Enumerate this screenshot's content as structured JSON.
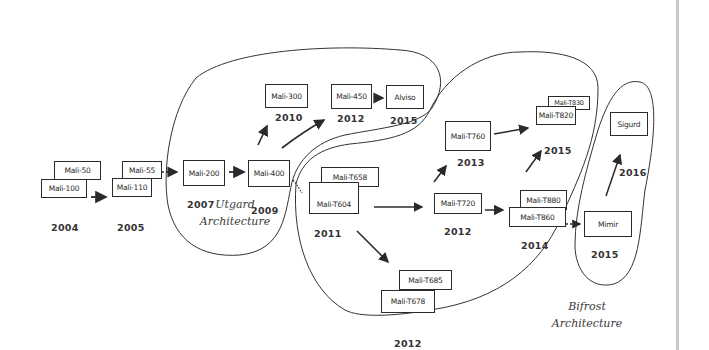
{
  "diagram": {
    "type": "hand-drawn GPU family timeline",
    "colors": {
      "ink": "#2a2a2a",
      "paper": "#ffffff",
      "page_border": "#c9c9c9"
    },
    "architectures": [
      {
        "id": "utgard",
        "line1": "Utgard",
        "line2": "Architecture"
      },
      {
        "id": "midgard",
        "line1": "Midgard",
        "line2": "Architecture"
      },
      {
        "id": "bifrost",
        "line1": "Bifrost",
        "line2": "Architecture"
      }
    ],
    "nodes": {
      "mali50": "Mali-50",
      "mali100": "Mali-100",
      "mali55": "Mali-55",
      "mali110": "Mali-110",
      "mali200": "Mali-200",
      "mali400": "Mali-400",
      "mali300": "Mali-300",
      "mali450": "Mali-450",
      "alviso": "Alviso",
      "t658": "Mali-T658",
      "t604": "Mali-T604",
      "t685": "Mali-T685",
      "t678": "Mali-T678",
      "t720": "Mali-T720",
      "t760": "Mali-T760",
      "t880": "Mali-T880",
      "t860": "Mali-T860",
      "t830": "Mali-T830",
      "t820": "Mali-T820",
      "mimir": "Mimir",
      "sigurd": "Sigurd"
    },
    "years": {
      "y2004": "2004",
      "y2005": "2005",
      "y2007": "2007",
      "y2009": "2009",
      "y2010": "2010",
      "y2012_utgard": "2012",
      "y2015_alviso": "2015",
      "y2011": "2011",
      "y2012_t678": "2012",
      "y2012_t720": "2012",
      "y2013": "2013",
      "y2014": "2014",
      "y2015_t820": "2015",
      "y2015_mimir": "2015",
      "y2016": "2016"
    },
    "edges": [
      {
        "from": "Mali-100",
        "to": "Mali-110",
        "style": "solid"
      },
      {
        "from": "Mali-55",
        "to": "Mali-200",
        "style": "dotted"
      },
      {
        "from": "Mali-200",
        "to": "Mali-400",
        "style": "solid"
      },
      {
        "from": "Mali-400",
        "to": "Mali-300",
        "style": "solid"
      },
      {
        "from": "Mali-400",
        "to": "Mali-450",
        "style": "solid"
      },
      {
        "from": "Mali-450",
        "to": "Alviso",
        "style": "solid"
      },
      {
        "from": "Mali-400",
        "to": "Mali-T604",
        "style": "dotted"
      },
      {
        "from": "Mali-T604",
        "to": "Mali-T720",
        "style": "solid"
      },
      {
        "from": "Mali-T604",
        "to": "Mali-T678",
        "style": "solid"
      },
      {
        "from": "Mali-T720",
        "to": "Mali-T760",
        "style": "solid"
      },
      {
        "from": "Mali-T720",
        "to": "Mali-T860",
        "style": "solid"
      },
      {
        "from": "Mali-T760",
        "to": "Mali-T820",
        "style": "solid"
      },
      {
        "from": "Mali-T860",
        "to": "Mali-T820",
        "style": "solid"
      },
      {
        "from": "Mali-T860",
        "to": "Mimir",
        "style": "dotted"
      },
      {
        "from": "Mimir",
        "to": "Sigurd",
        "style": "solid"
      }
    ]
  }
}
